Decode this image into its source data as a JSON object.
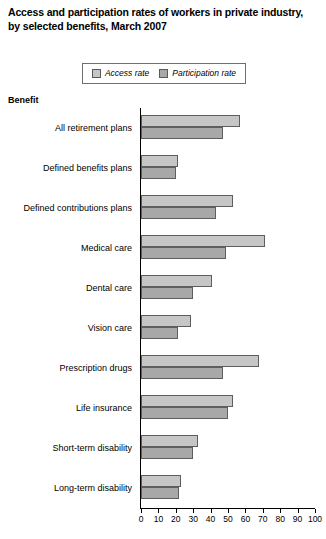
{
  "title": {
    "line1": "Access and participation rates of workers in private industry,",
    "line2": "by selected benefits, March 2007"
  },
  "legend": {
    "items": [
      {
        "label": "Access rate",
        "color": "#c6c6c6"
      },
      {
        "label": "Participation rate",
        "color": "#a8a8a8"
      }
    ]
  },
  "axis_header": "Benefit",
  "chart_data": {
    "type": "bar",
    "orientation": "horizontal",
    "title": "Access and participation rates of workers in private industry, by selected benefits, March 2007",
    "xlabel": "",
    "ylabel": "Benefit",
    "xlim": [
      0,
      100
    ],
    "xticks": [
      0,
      10,
      20,
      30,
      40,
      50,
      60,
      70,
      80,
      90,
      100
    ],
    "xtick_labels": [
      "0",
      "10",
      "20",
      "30",
      "40",
      "50",
      "60",
      "70",
      "80",
      "90",
      "100"
    ],
    "grid": false,
    "legend_position": "top",
    "categories": [
      "All retirement plans",
      "Defined benefits plans",
      "Defined contributions plans",
      "Medical care",
      "Dental care",
      "Vision care",
      "Prescription drugs",
      "Life insurance",
      "Short-term disability",
      "Long-term disability"
    ],
    "series": [
      {
        "name": "Access rate",
        "color": "#c6c6c6",
        "values": [
          57,
          21,
          53,
          71,
          41,
          29,
          68,
          53,
          33,
          23
        ]
      },
      {
        "name": "Participation rate",
        "color": "#a8a8a8",
        "values": [
          47,
          20,
          43,
          49,
          30,
          21,
          47,
          50,
          30,
          22
        ]
      }
    ]
  }
}
